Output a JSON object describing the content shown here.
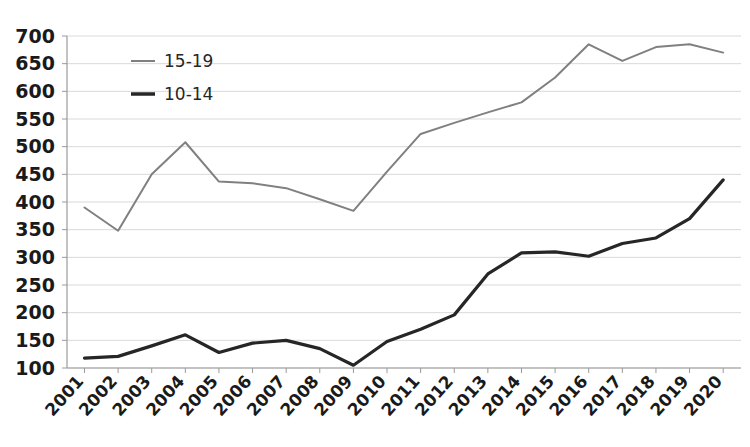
{
  "chart_data": {
    "type": "line",
    "title": "",
    "subtitle": "",
    "xlabel": "",
    "ylabel": "",
    "grid": true,
    "legend_position": "top-left-inside",
    "ylim": [
      100,
      700
    ],
    "ytick_step": 50,
    "yticks": [
      100,
      150,
      200,
      250,
      300,
      350,
      400,
      450,
      500,
      550,
      600,
      650,
      700
    ],
    "categories": [
      "2001",
      "2002",
      "2003",
      "2004",
      "2005",
      "2006",
      "2007",
      "2008",
      "2009",
      "2010",
      "2011",
      "2012",
      "2013",
      "2014",
      "2015",
      "2016",
      "2017",
      "2018",
      "2019",
      "2020"
    ],
    "series": [
      {
        "name": "15-19",
        "color": "#808080",
        "values": [
          390,
          348,
          450,
          508,
          437,
          434,
          425,
          405,
          384,
          455,
          523,
          543,
          562,
          580,
          625,
          685,
          655,
          680,
          685,
          670
        ]
      },
      {
        "name": "10-14",
        "color": "#262626",
        "values": [
          118,
          121,
          140,
          160,
          128,
          145,
          150,
          135,
          105,
          148,
          170,
          196,
          270,
          308,
          310,
          302,
          325,
          335,
          370,
          440
        ]
      }
    ]
  },
  "legend": {
    "items": [
      {
        "label": "15-19",
        "color": "#808080",
        "stroke_width": 2
      },
      {
        "label": "10-14",
        "color": "#262626",
        "stroke_width": 3.5
      }
    ]
  },
  "colors": {
    "gridline": "#d9d9d9",
    "axis": "#9a9a9a",
    "text": "#1a1a1a",
    "background": "#ffffff",
    "series_15_19": "#808080",
    "series_10_14": "#262626"
  }
}
